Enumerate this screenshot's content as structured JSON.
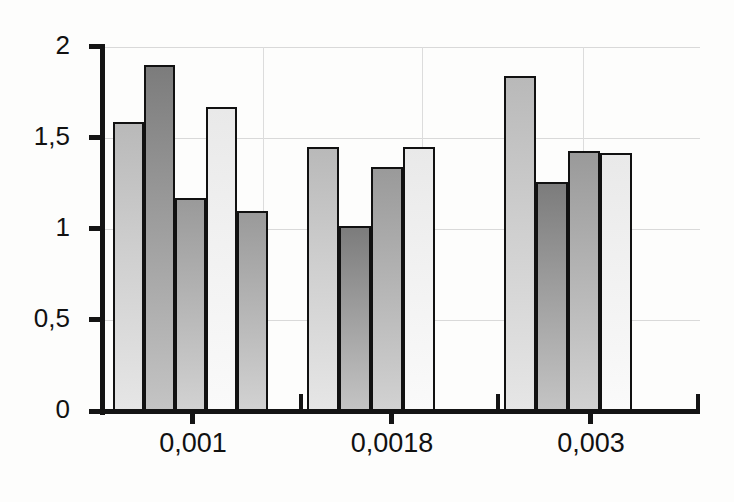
{
  "chart_data": {
    "type": "bar",
    "title": "",
    "subtitle": "",
    "xlabel": "",
    "ylabel": "",
    "categories": [
      "0,001",
      "0,0018",
      "0,003"
    ],
    "ylim": [
      0,
      2
    ],
    "yticks": [
      0,
      0.5,
      1,
      1.5,
      2
    ],
    "ytick_labels": [
      "0",
      "0,5",
      "1",
      "1,5",
      "2"
    ],
    "grid": "horizontal-and-vertical",
    "legend": "none",
    "decimal_separator": "comma",
    "groups": [
      {
        "category": "0,001",
        "bar_count": 5,
        "values": [
          1.59,
          1.9,
          1.17,
          1.67,
          1.1
        ]
      },
      {
        "category": "0,0018",
        "bar_count": 4,
        "values": [
          1.45,
          1.02,
          1.34,
          1.45
        ]
      },
      {
        "category": "0,003",
        "bar_count": 4,
        "values": [
          1.84,
          1.26,
          1.43,
          1.42
        ]
      }
    ],
    "series": [
      {
        "name": "bar-1",
        "values": [
          1.59,
          1.45,
          1.84
        ]
      },
      {
        "name": "bar-2",
        "values": [
          1.9,
          1.02,
          1.26
        ]
      },
      {
        "name": "bar-3",
        "values": [
          1.17,
          1.34,
          1.43
        ]
      },
      {
        "name": "bar-4",
        "values": [
          1.67,
          1.45,
          1.42
        ]
      },
      {
        "name": "bar-5",
        "values": [
          1.1,
          null,
          null
        ]
      }
    ],
    "colors": {
      "axis": "#141414",
      "gridline": "#d9d9d9",
      "bar_outline": "#111111",
      "fill_light": "#e9e9e9",
      "fill_mid_light": "#cfcfcf",
      "fill_mid": "#b3b3b3",
      "fill_dark": "#7c7c7c",
      "background": "#fdfdfc"
    }
  }
}
